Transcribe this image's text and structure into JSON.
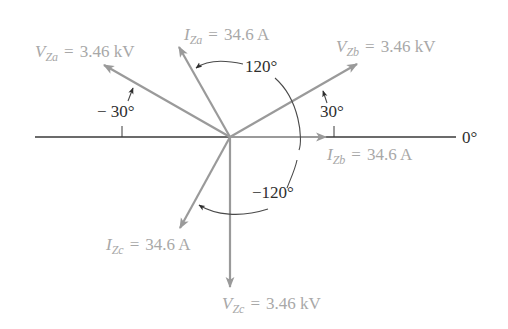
{
  "diagram": {
    "type": "three-phase phasor diagram",
    "colors": {
      "phasor": "#9a9a9a",
      "label": "#a8a8a8",
      "reference_line": "#3a3a3a",
      "angle_text": "#2e2e2e"
    },
    "reference": {
      "label": "0°"
    },
    "phasors": [
      {
        "id": "VZa",
        "symbol": "V",
        "subscript": "Za",
        "equals": "=",
        "value": "3.46 kV",
        "angle_deg": 150
      },
      {
        "id": "IZa",
        "symbol": "I",
        "subscript": "Za",
        "equals": "=",
        "value": "34.6 A",
        "angle_deg": 120
      },
      {
        "id": "VZb",
        "symbol": "V",
        "subscript": "Zb",
        "equals": "=",
        "value": "3.46 kV",
        "angle_deg": 30
      },
      {
        "id": "IZb",
        "symbol": "I",
        "subscript": "Zb",
        "equals": "=",
        "value": "34.6 A",
        "angle_deg": 0
      },
      {
        "id": "IZc",
        "symbol": "I",
        "subscript": "Zc",
        "equals": "=",
        "value": "34.6 A",
        "angle_deg": -120
      },
      {
        "id": "VZc",
        "symbol": "V",
        "subscript": "Zc",
        "equals": "=",
        "value": "3.46 kV",
        "angle_deg": -90
      }
    ],
    "angle_annotations": {
      "va_offset": "− 30°",
      "vb_offset": "30°",
      "ia_arc": "120°",
      "ic_arc": "−120°"
    }
  }
}
